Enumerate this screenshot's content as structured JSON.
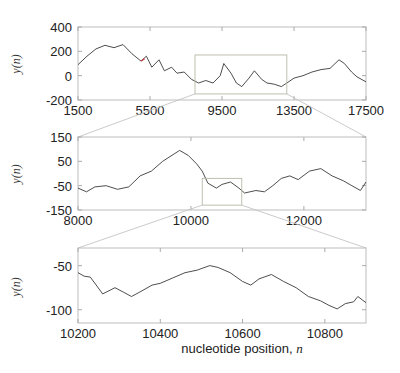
{
  "figure": {
    "xlabel_text": "nucleotide position, ",
    "xlabel_var": "n",
    "ylabel": "y(n)"
  },
  "chart_data": [
    {
      "type": "line",
      "panel": "top",
      "title": "",
      "xlabel": "",
      "ylabel": "y(n)",
      "xlim": [
        1500,
        17500
      ],
      "ylim": [
        -200,
        400
      ],
      "xticks": [
        1500,
        5500,
        9500,
        13500,
        17500
      ],
      "yticks": [
        400,
        200,
        0,
        -200
      ],
      "zoom_box": {
        "x": [
          8000,
          13100
        ],
        "y": [
          -150,
          170
        ]
      },
      "highlight_color": "#cc3333",
      "x": [
        1500,
        2000,
        2500,
        3000,
        3500,
        4000,
        4500,
        5000,
        5300,
        5600,
        6000,
        6300,
        6700,
        7000,
        7400,
        7800,
        8200,
        8600,
        9000,
        9400,
        9600,
        10000,
        10300,
        10600,
        11000,
        11300,
        11700,
        12000,
        12400,
        12800,
        13100,
        13500,
        14000,
        14500,
        15000,
        15500,
        16000,
        16300,
        16700,
        17000,
        17500
      ],
      "values": [
        90,
        160,
        220,
        250,
        230,
        255,
        180,
        120,
        160,
        70,
        130,
        40,
        70,
        20,
        30,
        -30,
        -60,
        -40,
        -60,
        0,
        100,
        20,
        -60,
        -90,
        -20,
        40,
        -30,
        -60,
        -70,
        -90,
        -60,
        -20,
        0,
        30,
        50,
        60,
        130,
        100,
        30,
        -10,
        -50
      ],
      "grid": false
    },
    {
      "type": "line",
      "panel": "middle",
      "title": "",
      "xlabel": "",
      "ylabel": "y(n)",
      "xlim": [
        8000,
        13100
      ],
      "ylim": [
        -150,
        150
      ],
      "xticks": [
        8000,
        10000,
        12000
      ],
      "yticks": [
        150,
        50,
        -50,
        -150
      ],
      "zoom_box": {
        "x": [
          10200,
          10900
        ],
        "y": [
          -130,
          -20
        ]
      },
      "x": [
        8000,
        8150,
        8300,
        8500,
        8700,
        8900,
        9100,
        9300,
        9500,
        9700,
        9800,
        9950,
        10100,
        10200,
        10300,
        10450,
        10550,
        10700,
        10850,
        10950,
        11150,
        11300,
        11450,
        11600,
        11750,
        11900,
        12100,
        12300,
        12500,
        12700,
        12850,
        13000,
        13100
      ],
      "values": [
        -60,
        -75,
        -55,
        -50,
        -65,
        -55,
        -10,
        10,
        50,
        80,
        95,
        75,
        40,
        10,
        -40,
        -60,
        -45,
        -35,
        -60,
        -80,
        -70,
        -75,
        -50,
        -20,
        -10,
        -25,
        10,
        20,
        -10,
        -30,
        -50,
        -70,
        -35
      ],
      "grid": false
    },
    {
      "type": "line",
      "panel": "bottom",
      "title": "",
      "xlabel": "nucleotide position, n",
      "ylabel": "y(n)",
      "xlim": [
        10200,
        10900
      ],
      "ylim": [
        -115,
        -30
      ],
      "xticks": [
        10200,
        10400,
        10600,
        10800
      ],
      "yticks": [
        -50,
        -100
      ],
      "x": [
        10200,
        10215,
        10230,
        10260,
        10290,
        10310,
        10330,
        10350,
        10380,
        10400,
        10430,
        10460,
        10490,
        10520,
        10540,
        10570,
        10600,
        10620,
        10640,
        10670,
        10700,
        10730,
        10760,
        10790,
        10810,
        10830,
        10850,
        10870,
        10880,
        10900
      ],
      "values": [
        -58,
        -62,
        -63,
        -82,
        -75,
        -80,
        -85,
        -80,
        -72,
        -70,
        -64,
        -58,
        -55,
        -50,
        -52,
        -58,
        -68,
        -72,
        -65,
        -60,
        -68,
        -75,
        -85,
        -90,
        -95,
        -99,
        -93,
        -91,
        -85,
        -92
      ],
      "grid": false
    }
  ]
}
